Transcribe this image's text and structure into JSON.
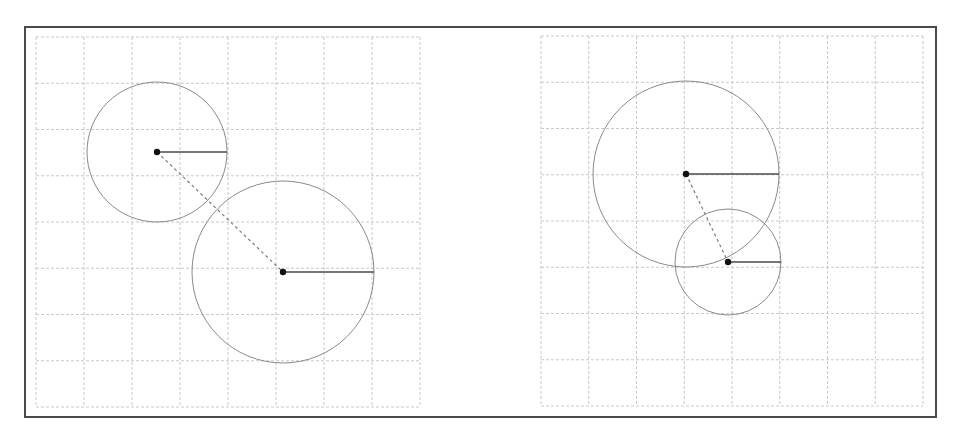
{
  "figure": {
    "width": 967,
    "height": 434,
    "frame": {
      "x": 25,
      "y": 27,
      "width": 911,
      "height": 390,
      "color": "#4a4a4a"
    },
    "colors": {
      "grid": "#c8c8c8",
      "circle": "#8a8a8a",
      "radius": "#4a4a4a",
      "connector": "#7a7a7a",
      "dot": "#111111"
    },
    "panels": [
      {
        "id": "left",
        "label": "separated-circles",
        "grid": {
          "x": 36,
          "y": 37,
          "width": 384,
          "height": 370,
          "cols": 8,
          "rows": 8
        },
        "circles": [
          {
            "id": "c1",
            "cx": 157,
            "cy": 152,
            "r": 70
          },
          {
            "id": "c2",
            "cx": 283,
            "cy": 272,
            "r": 91
          }
        ],
        "connector": {
          "from": "c1",
          "to": "c2"
        }
      },
      {
        "id": "right",
        "label": "overlapping-circles",
        "grid": {
          "x": 541,
          "y": 36,
          "width": 382,
          "height": 370,
          "cols": 8,
          "rows": 8
        },
        "circles": [
          {
            "id": "cA",
            "cx": 686,
            "cy": 174,
            "r": 93
          },
          {
            "id": "cB",
            "cx": 728,
            "cy": 262,
            "r": 53
          }
        ],
        "connector": {
          "from": "cA",
          "to": "cB"
        }
      }
    ]
  }
}
